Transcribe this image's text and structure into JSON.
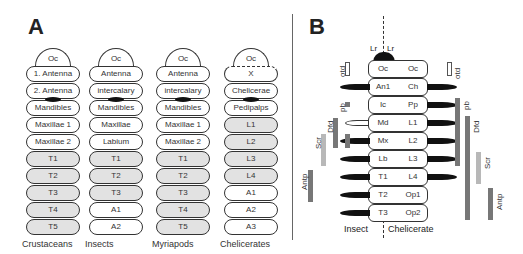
{
  "panel_a": {
    "letter": "A",
    "columns": [
      {
        "name": "Crustaceans",
        "cap": "Oc",
        "segments": [
          "1. Antenna",
          "2. Antenna",
          "Mandibles",
          "Maxillae 1",
          "Maxillae 2",
          "T1",
          "T2",
          "T3",
          "T4",
          "T5"
        ],
        "shaded_from": 5,
        "blob_after": 1
      },
      {
        "name": "Insects",
        "cap": "Oc",
        "segments": [
          "Antenna",
          "intercalary",
          "Mandibles",
          "Maxillae",
          "Labium",
          "T1",
          "T2",
          "T3",
          "A1",
          "A2"
        ],
        "shaded_from": 5,
        "shaded_to": 7,
        "blob_after": 1
      },
      {
        "name": "Myriapods",
        "cap": "Oc",
        "segments": [
          "Antenna",
          "intercalary",
          "Mandibles",
          "Maxillae 1",
          "Maxillae 2",
          "T1",
          "T2",
          "T3",
          "T4",
          "T5"
        ],
        "shaded_from": 5,
        "blob_after": 1
      },
      {
        "name": "Chelicerates",
        "cap": "Oc",
        "segments": [
          "X",
          "Chelicerae",
          "Pedipalps",
          "L1",
          "L2",
          "L3",
          "L4",
          "A1",
          "A2",
          "A3"
        ],
        "shaded_from": 3,
        "shaded_to": 6,
        "blob_after": 1,
        "cap_dashed": true
      }
    ]
  },
  "panel_b": {
    "letter": "B",
    "top_label_left": "Lr",
    "top_label_right": "Lr",
    "insect_cells": [
      "Oc",
      "An1",
      "Ic",
      "Md",
      "Mx",
      "Lb",
      "T1",
      "T2",
      "T3"
    ],
    "chelicerate_cells": [
      "Oc",
      "Ch",
      "Pp",
      "L1",
      "L2",
      "L3",
      "L4",
      "Op1",
      "Op2"
    ],
    "bottom_left": "Insect",
    "bottom_right": "Chelicerate",
    "left_genes": [
      {
        "name": "otd",
        "from": 0,
        "to": 0,
        "style": "outline"
      },
      {
        "name": "pb",
        "from": 2,
        "to": 2,
        "style": "dark-small"
      },
      {
        "name": "Dfd",
        "from": 3,
        "to": 4,
        "style": "dark"
      },
      {
        "name": "Scr",
        "from": 4,
        "to": 5,
        "style": "light"
      },
      {
        "name": "Antp",
        "from": 6,
        "to": 7,
        "style": "dark"
      }
    ],
    "right_genes": [
      {
        "name": "otd",
        "from": 0,
        "to": 0,
        "style": "outline"
      },
      {
        "name": "pb",
        "from": 2,
        "to": 5,
        "style": "dark"
      },
      {
        "name": "Dfd",
        "from": 3,
        "to": 8,
        "style": "dark"
      },
      {
        "name": "Scr",
        "from": 5,
        "to": 6,
        "style": "light"
      },
      {
        "name": "Antp",
        "from": 7,
        "to": 8,
        "style": "dark"
      }
    ],
    "colors": {
      "dark_bar": "#777777",
      "light_bar": "#b8b8b8",
      "appendage": "#111111"
    }
  }
}
